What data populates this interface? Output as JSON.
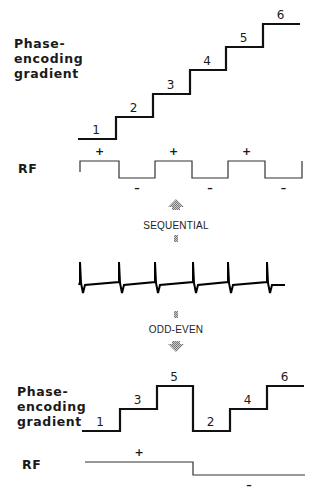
{
  "colors": {
    "line": "#111111",
    "rf_line": "#333333",
    "arrow_fill": "#9a9a9a",
    "background": "#ffffff"
  },
  "top_panel": {
    "gradient_label": [
      "Phase-",
      "encoding",
      "gradient"
    ],
    "rf_label": "RF",
    "steps": [
      {
        "label": "1",
        "x1": 78,
        "x2": 116,
        "y": 139
      },
      {
        "label": "2",
        "x1": 116,
        "x2": 153,
        "y": 117
      },
      {
        "label": "3",
        "x1": 153,
        "x2": 190,
        "y": 94
      },
      {
        "label": "4",
        "x1": 190,
        "x2": 226,
        "y": 70
      },
      {
        "label": "5",
        "x1": 226,
        "x2": 263,
        "y": 47
      },
      {
        "label": "6",
        "x1": 263,
        "x2": 300,
        "y": 24
      }
    ],
    "rf_segments": [
      {
        "sign": "+",
        "x1": 80,
        "x2": 119,
        "level": "high"
      },
      {
        "sign": "–",
        "x1": 119,
        "x2": 155,
        "level": "low"
      },
      {
        "sign": "+",
        "x1": 155,
        "x2": 192,
        "level": "high"
      },
      {
        "sign": "–",
        "x1": 192,
        "x2": 228,
        "level": "low"
      },
      {
        "sign": "+",
        "x1": 228,
        "x2": 265,
        "level": "high"
      },
      {
        "sign": "–",
        "x1": 265,
        "x2": 302,
        "level": "low"
      }
    ],
    "rf_high_y": 161,
    "rf_low_y": 178
  },
  "sequential": {
    "label": "SEQUENTIAL",
    "arrow": "up-arrow"
  },
  "ecg": {
    "baseline_y": 285,
    "x_start": 79,
    "x_end": 285,
    "beats_x": [
      80,
      119,
      155,
      193,
      228,
      267
    ],
    "peak_y": 262,
    "dip_y": 293
  },
  "odd_even": {
    "label": "ODD-EVEN",
    "arrow": "down-arrow"
  },
  "bottom_panel": {
    "gradient_label": [
      "Phase-",
      "encoding",
      "gradient"
    ],
    "rf_label": "RF",
    "steps": [
      {
        "label": "1",
        "x1": 82,
        "x2": 120,
        "y": 431
      },
      {
        "label": "3",
        "x1": 120,
        "x2": 157,
        "y": 409
      },
      {
        "label": "5",
        "x1": 157,
        "x2": 193,
        "y": 386
      },
      {
        "label": "2",
        "x1": 193,
        "x2": 230,
        "y": 431
      },
      {
        "label": "4",
        "x1": 230,
        "x2": 267,
        "y": 409
      },
      {
        "label": "6",
        "x1": 267,
        "x2": 304,
        "y": 386
      }
    ],
    "rf_segments": [
      {
        "sign": "+",
        "x1": 85,
        "x2": 193,
        "level": "high"
      },
      {
        "sign": "–",
        "x1": 193,
        "x2": 305,
        "level": "low"
      }
    ],
    "rf_high_y": 462,
    "rf_low_y": 475
  }
}
